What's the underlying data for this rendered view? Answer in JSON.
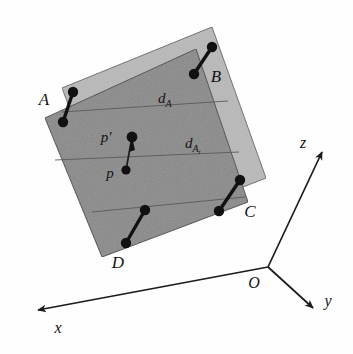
{
  "figure": {
    "background_color": "#fefefe",
    "planes": [
      {
        "id": "reference-plane",
        "name": "light-plane",
        "fill": "#b9b9b9",
        "stroke": "#6d6d6d",
        "points": "62,88 212,27 266,178 118,236"
      },
      {
        "id": "transformed-plane",
        "name": "dark-plane",
        "fill": "#8a8a8a",
        "stroke": "#4a4a4a",
        "points": "45,118 196,49 248,202 102,257"
      }
    ],
    "band_lines": [
      {
        "name": "band-line-upper",
        "path": "M 62,112 L 228,101"
      },
      {
        "name": "band-line-middle",
        "path": "M 55,160 L 239,152"
      },
      {
        "name": "band-line-lower",
        "path": "M 92,212 L 245,197"
      }
    ],
    "dumbbells": [
      {
        "name": "dumbbell-a",
        "x1": 73,
        "y1": 92,
        "x2": 63,
        "y2": 122
      },
      {
        "name": "dumbbell-b",
        "x1": 212,
        "y1": 47,
        "x2": 194,
        "y2": 74
      },
      {
        "name": "dumbbell-c",
        "x1": 240,
        "y1": 180,
        "x2": 219,
        "y2": 211
      },
      {
        "name": "dumbbell-d",
        "x1": 145,
        "y1": 210,
        "x2": 126,
        "y2": 243
      }
    ],
    "correspondence": {
      "name": "p-to-p-prime-connector",
      "x1": 132,
      "y1": 137,
      "x2": 126,
      "y2": 170
    },
    "vertex_labels": [
      {
        "name": "vertex-label-a",
        "text": "A",
        "x": 44,
        "y": 105
      },
      {
        "name": "vertex-label-b",
        "text": "B",
        "x": 216,
        "y": 82
      },
      {
        "name": "vertex-label-c",
        "text": "C",
        "x": 250,
        "y": 217
      },
      {
        "name": "vertex-label-d",
        "text": "D",
        "x": 118,
        "y": 268
      }
    ],
    "point_labels": [
      {
        "name": "point-label-p-prime",
        "text": "p'",
        "x": 106,
        "y": 142
      },
      {
        "name": "point-label-p",
        "text": "p",
        "x": 110,
        "y": 178
      }
    ],
    "distance_labels": [
      {
        "name": "distance-label-d-a",
        "base": "d",
        "sub": "A",
        "subsub": "",
        "x": 158,
        "y": 103
      },
      {
        "name": "distance-label-d-a-i",
        "base": "d",
        "sub": "A",
        "subsub": "i",
        "x": 185,
        "y": 148
      }
    ],
    "axes": {
      "origin": {
        "name": "axis-origin",
        "x": 268,
        "y": 267,
        "label": "O",
        "label_x": 254,
        "label_y": 288
      },
      "arrows": [
        {
          "name": "axis-z",
          "label": "z",
          "x1": 268,
          "y1": 267,
          "x2": 322,
          "y2": 152,
          "label_x": 303,
          "label_y": 148
        },
        {
          "name": "axis-y",
          "label": "y",
          "x1": 268,
          "y1": 267,
          "x2": 315,
          "y2": 310,
          "label_x": 327,
          "label_y": 306
        },
        {
          "name": "axis-x",
          "label": "x",
          "x1": 268,
          "y1": 267,
          "x2": 36,
          "y2": 311,
          "label_x": 58,
          "label_y": 333
        }
      ]
    },
    "markers": {
      "dot_radius": 5.2,
      "dot_color": "#111111",
      "connector_width": 3.4,
      "small_dot_radius": 4.4
    }
  }
}
